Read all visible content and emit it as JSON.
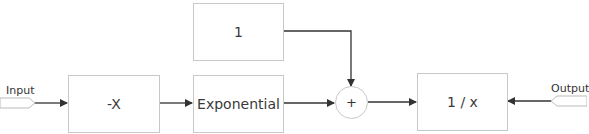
{
  "diagram": {
    "type": "block-diagram",
    "blocks": {
      "negate": {
        "label": "-X"
      },
      "constant": {
        "label": "1"
      },
      "exponential": {
        "label": "Exponential"
      },
      "adder": {
        "label": "+"
      },
      "reciprocal": {
        "label": "1 / x"
      }
    },
    "ports": {
      "input": {
        "label": "Input"
      },
      "output": {
        "label": "Output"
      }
    },
    "connections": [
      {
        "from": "input",
        "to": "negate"
      },
      {
        "from": "negate",
        "to": "exponential"
      },
      {
        "from": "exponential",
        "to": "adder"
      },
      {
        "from": "constant",
        "to": "adder"
      },
      {
        "from": "adder",
        "to": "reciprocal"
      },
      {
        "from": "output",
        "to": "reciprocal"
      }
    ],
    "colors": {
      "line": "#333333",
      "border": "#c8c8c8"
    }
  }
}
